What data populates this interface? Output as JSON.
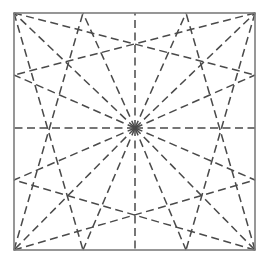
{
  "figure": {
    "canvas": {
      "width": 268,
      "height": 263,
      "background": "#ffffff"
    },
    "square": {
      "label": "bounding-square",
      "left": 14,
      "top": 13,
      "right": 255,
      "bottom": 250,
      "stroke_color": "#7d7d7d",
      "stroke_width": 1.6,
      "style": "solid"
    },
    "center": {
      "label": "convergence-center",
      "x": 135,
      "y": 128
    },
    "lines": {
      "style": "dashed",
      "stroke_color": "#4a4a4a",
      "stroke_width": 1.5,
      "dash_length": 8,
      "dash_gap": 4.5,
      "count": 16
    },
    "perimeter_points": [
      {
        "name": "top-left-corner",
        "x": 14,
        "y": 13
      },
      {
        "name": "top-vertex-left",
        "x": 83,
        "y": 13
      },
      {
        "name": "top-midpoint",
        "x": 135,
        "y": 13
      },
      {
        "name": "top-vertex-right",
        "x": 186,
        "y": 13
      },
      {
        "name": "top-right-corner",
        "x": 255,
        "y": 13
      },
      {
        "name": "right-vertex-upper",
        "x": 255,
        "y": 75
      },
      {
        "name": "right-midpoint",
        "x": 255,
        "y": 128
      },
      {
        "name": "right-vertex-lower",
        "x": 255,
        "y": 180
      },
      {
        "name": "bottom-right-corner",
        "x": 255,
        "y": 250
      },
      {
        "name": "bottom-vertex-right",
        "x": 186,
        "y": 250
      },
      {
        "name": "bottom-midpoint",
        "x": 135,
        "y": 250
      },
      {
        "name": "bottom-vertex-left",
        "x": 83,
        "y": 250
      },
      {
        "name": "bottom-left-corner",
        "x": 14,
        "y": 250
      },
      {
        "name": "left-vertex-lower",
        "x": 14,
        "y": 180
      },
      {
        "name": "left-midpoint",
        "x": 14,
        "y": 128
      },
      {
        "name": "left-vertex-upper",
        "x": 14,
        "y": 75
      }
    ],
    "chords": [
      {
        "name": "chord-top-left-corner-to-right-upper",
        "x1": 14,
        "y1": 13,
        "x2": 255,
        "y2": 75
      },
      {
        "name": "chord-top-right-corner-to-left-upper",
        "x1": 255,
        "y1": 13,
        "x2": 14,
        "y2": 75
      },
      {
        "name": "chord-top-left-corner-to-bottom-left-vertex",
        "x1": 14,
        "y1": 13,
        "x2": 83,
        "y2": 250
      },
      {
        "name": "chord-top-right-corner-to-bottom-right-vertex",
        "x1": 255,
        "y1": 13,
        "x2": 186,
        "y2": 250
      },
      {
        "name": "chord-bottom-left-corner-to-right-lower",
        "x1": 14,
        "y1": 250,
        "x2": 255,
        "y2": 180
      },
      {
        "name": "chord-bottom-right-corner-to-left-lower",
        "x1": 255,
        "y1": 250,
        "x2": 14,
        "y2": 180
      },
      {
        "name": "chord-bottom-left-corner-to-top-left-vertex",
        "x1": 14,
        "y1": 250,
        "x2": 83,
        "y2": 13
      },
      {
        "name": "chord-bottom-right-corner-to-top-right-vertex",
        "x1": 255,
        "y1": 250,
        "x2": 186,
        "y2": 13
      }
    ]
  }
}
